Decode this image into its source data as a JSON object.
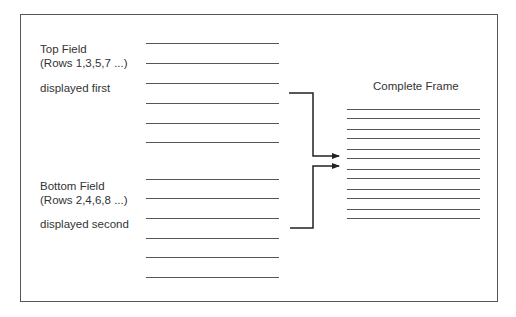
{
  "diagram": {
    "top_field": {
      "title": "Top Field",
      "rows": "(Rows 1,3,5,7 ...)",
      "order": "displayed first",
      "line_count": 6
    },
    "bottom_field": {
      "title": "Bottom Field",
      "rows": "(Rows 2,4,6,8 ...)",
      "order": "displayed second",
      "line_count": 6
    },
    "complete_frame": {
      "title": "Complete Frame",
      "line_count": 12
    },
    "colors": {
      "line": "#555555",
      "border": "#555555",
      "arrow": "#222222",
      "text": "#333333"
    }
  }
}
